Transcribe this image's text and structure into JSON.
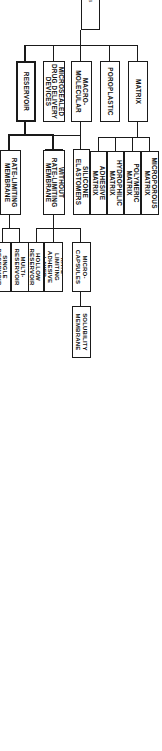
{
  "diagram": {
    "title": "Transdermal Devices",
    "type": "hierarchy-tree",
    "orientation": "rotated-90-clockwise",
    "colors": {
      "line": "#1a1a1a",
      "box_border": "#1a1a1a",
      "box_fill": "#ffffff",
      "root_text": "#3a3a3a",
      "text": "#111111",
      "background": "#ffffff"
    },
    "nodes": {
      "root": "Transdermal Devices",
      "microsealed": "MICROSEALED\nDRUG DELIVERY\nDEVICES",
      "macromolecular": "MACRO-\nMOLECULAR",
      "poroplastic": "POROPLASTIC",
      "matrix": "MATRIX",
      "reservoir": "RESERVOIR",
      "eva_copolymers": "EVA\nCOPOLYMERS",
      "silicone_elastomers": "SILICONE\nELASTOMERS",
      "adhesive_matrix": "ADHESIVE\nMATRIX",
      "hydrophilic_matrix": "HYDROPHILIC\nMATRIX",
      "polymeric_matrix": "POLYMERIC\nMATRIX",
      "microporous_matrix": "MICROPOROUS\nMATRIX",
      "without_rate_limiting_membrane": "WITHOUT\nRATE-LIMITING\nMEMBRANE",
      "rate_limiting_membrane": "RATE-LIMITING\nMEMBRANE",
      "solubility_membrane": "SOLUBILITY\nMEMBRANE",
      "micro_capsules": "MICRO-\nCAPSULES",
      "rate_limiting_adhesive_layer": "RATE-LIMITING\nADHESIVE LAYER",
      "hollow_reservoir": "HOLLOW\nRESERVOIR",
      "multi_reservoir": "MULTI-\nRESERVOIR",
      "single_reservoir": "SINGLE\nRESERVOIR"
    }
  }
}
